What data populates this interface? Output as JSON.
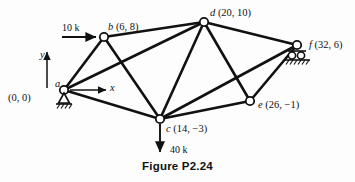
{
  "figure": {
    "caption": "Figure P2.24",
    "axes": {
      "x_label": "x",
      "y_label": "y"
    },
    "nodes": [
      {
        "id": "a",
        "name": "a",
        "coords": "(0, 0)",
        "px": 64,
        "py": 90,
        "support": "pin"
      },
      {
        "id": "b",
        "name": "b",
        "coords": "(6, 8)",
        "px": 104,
        "py": 37,
        "support": "none"
      },
      {
        "id": "c",
        "name": "c",
        "coords": "(14, −3)",
        "px": 160,
        "py": 119,
        "support": "none"
      },
      {
        "id": "d",
        "name": "d",
        "coords": "(20, 10)",
        "px": 204,
        "py": 22,
        "support": "none"
      },
      {
        "id": "e",
        "name": "e",
        "coords": "(26, −1)",
        "px": 250,
        "py": 101,
        "support": "none"
      },
      {
        "id": "f",
        "name": "f",
        "coords": "(32, 6)",
        "px": 297,
        "py": 45,
        "support": "roller"
      }
    ],
    "members": [
      {
        "from": "a",
        "to": "b"
      },
      {
        "from": "a",
        "to": "c"
      },
      {
        "from": "a",
        "to": "d"
      },
      {
        "from": "b",
        "to": "d"
      },
      {
        "from": "b",
        "to": "c"
      },
      {
        "from": "c",
        "to": "d"
      },
      {
        "from": "c",
        "to": "e"
      },
      {
        "from": "c",
        "to": "f"
      },
      {
        "from": "d",
        "to": "e"
      },
      {
        "from": "d",
        "to": "f"
      },
      {
        "from": "e",
        "to": "f"
      }
    ],
    "loads": [
      {
        "at": "b",
        "label": "10 k",
        "direction": "right"
      },
      {
        "at": "c",
        "label": "40 k",
        "direction": "down"
      }
    ]
  }
}
